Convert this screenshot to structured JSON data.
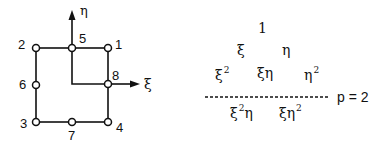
{
  "element_diagram": {
    "nodes": [
      {
        "id": "1",
        "label": "1"
      },
      {
        "id": "2",
        "label": "2"
      },
      {
        "id": "3",
        "label": "3"
      },
      {
        "id": "4",
        "label": "4"
      },
      {
        "id": "5",
        "label": "5"
      },
      {
        "id": "6",
        "label": "6"
      },
      {
        "id": "7",
        "label": "7"
      },
      {
        "id": "8",
        "label": "8"
      }
    ],
    "axes": {
      "vertical": "η",
      "horizontal": "ξ"
    }
  },
  "pascal_triangle": {
    "row0": [
      "1"
    ],
    "row1": [
      "ξ",
      "η"
    ],
    "row2": [
      {
        "base": "ξ",
        "exp": "2"
      },
      {
        "base": "ξη",
        "exp": ""
      },
      {
        "base": "η",
        "exp": "2"
      }
    ],
    "divider_label": "p = 2",
    "row3": [
      {
        "base1": "ξ",
        "exp": "2",
        "base2": "η"
      },
      {
        "base1": "ξη",
        "exp": "2",
        "base2": ""
      }
    ]
  }
}
